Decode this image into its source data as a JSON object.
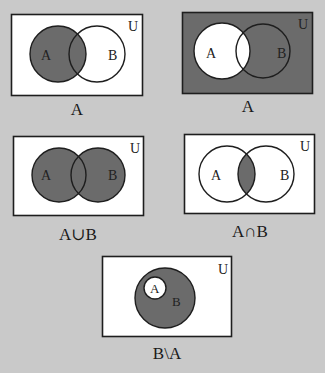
{
  "colors": {
    "background": "#c9c9c9",
    "shade": "#6b6b6b",
    "white": "#ffffff",
    "stroke": "#1e1e1e"
  },
  "universe_label": "U",
  "diagrams": [
    {
      "id": "complement-b-shaded-a",
      "caption": "A",
      "shaded_region": "A",
      "circle_a_label": "A",
      "circle_b_label": "B",
      "universe_label": "U"
    },
    {
      "id": "complement-of-a",
      "caption": "A",
      "shaded_region": "U \\ A",
      "circle_a_label": "A",
      "circle_b_label": "B",
      "universe_label": "U"
    },
    {
      "id": "union",
      "caption": "A∪B",
      "shaded_region": "A ∪ B",
      "circle_a_label": "A",
      "circle_b_label": "B",
      "universe_label": "U"
    },
    {
      "id": "intersection",
      "caption": "A∩B",
      "shaded_region": "A ∩ B",
      "circle_a_label": "A",
      "circle_b_label": "B",
      "universe_label": "U"
    },
    {
      "id": "difference",
      "caption": "B\\A",
      "shaded_region": "B \\ A",
      "circle_a_label": "A",
      "circle_b_label": "B",
      "universe_label": "U"
    }
  ]
}
